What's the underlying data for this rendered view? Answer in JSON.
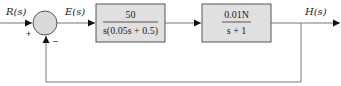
{
  "diagram": {
    "type": "feedback-control-block-diagram",
    "input": {
      "label": "R(s)"
    },
    "summing_junction": {
      "plus_sign": "+",
      "minus_sign": "–"
    },
    "error": {
      "label": "E(s)"
    },
    "blocks": [
      {
        "numerator": "50",
        "denominator": "s(0.05s + 0.5)"
      },
      {
        "numerator": "0.01N",
        "denominator": "s + 1"
      }
    ],
    "output": {
      "label": "H(s)"
    },
    "colors": {
      "block_fill": "#e0e0e0",
      "junction_fill": "#d9d9d9",
      "stroke": "#555555",
      "line": "#777777"
    }
  }
}
